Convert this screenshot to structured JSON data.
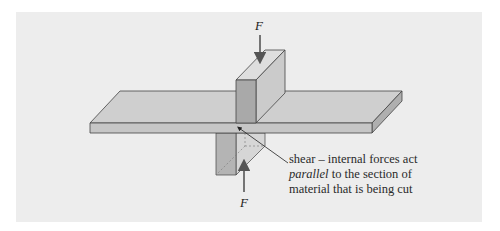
{
  "figure": {
    "top_force_label": "F",
    "bottom_force_label": "F",
    "caption": {
      "line1": "shear – internal forces act",
      "line2_italic": "parallel",
      "line2_rest": " to the section of",
      "line3": "material that is being cut"
    },
    "colors": {
      "background": "#ffffff",
      "panel": "#ededed",
      "plate_top": "#cfcfcf",
      "plate_front": "#c4c4c4",
      "plate_side": "#b0b0b0",
      "block_front": "#a9a9a9",
      "block_side": "#cacaca",
      "block_top": "#dcdcdc",
      "arrow": "#555555"
    }
  }
}
